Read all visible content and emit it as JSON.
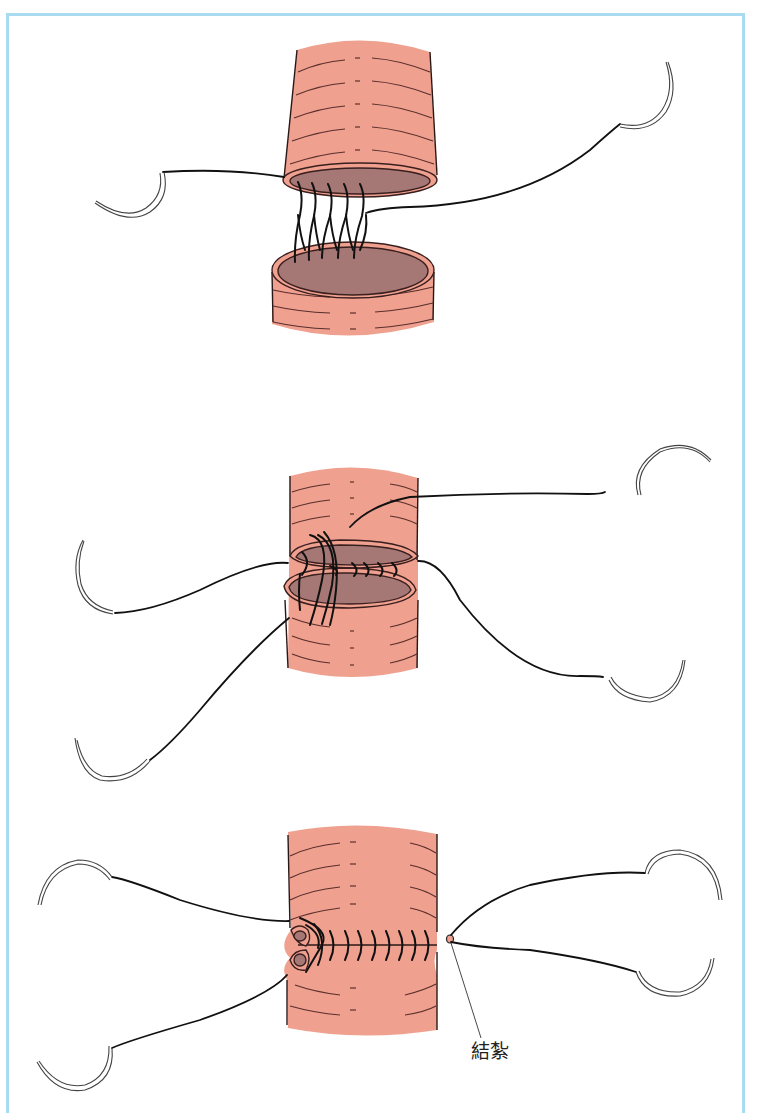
{
  "figure": {
    "border_color": "#a8daf0",
    "tissue_color": "#efa08f",
    "lumen_color": "#a57775",
    "thread_color": "#111111",
    "panels": [
      {
        "step": 1,
        "description": "two bowel ends with posterior stitches placed between cut edges"
      },
      {
        "step": 2,
        "description": "ends approximated with running sutures along lumen"
      },
      {
        "step": 3,
        "description": "anastomosis completed with inverted suture line"
      }
    ],
    "annotation": {
      "label": "結紮"
    }
  }
}
